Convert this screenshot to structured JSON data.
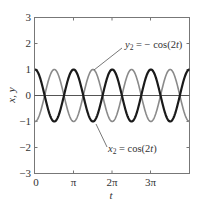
{
  "chart_data": {
    "type": "line",
    "title": "",
    "xlabel": "t",
    "ylabel": "x, y",
    "xlim": [
      0,
      12.566
    ],
    "ylim": [
      -3,
      3
    ],
    "grid": false,
    "xticks": [
      {
        "value": 0,
        "label": "0"
      },
      {
        "value": 3.14159,
        "label": "π"
      },
      {
        "value": 6.28319,
        "label": "2π"
      },
      {
        "value": 9.42478,
        "label": "3π"
      }
    ],
    "yticks": [
      {
        "value": 3,
        "label": "3"
      },
      {
        "value": 2,
        "label": "2"
      },
      {
        "value": 1,
        "label": "1"
      },
      {
        "value": 0,
        "label": "0"
      },
      {
        "value": -1,
        "label": "−1"
      },
      {
        "value": -2,
        "label": "−2"
      },
      {
        "value": -3,
        "label": "−3"
      }
    ],
    "series": [
      {
        "name": "x2 = cos(2t)",
        "expression": "cos(2t)",
        "color": "#1a1a1a",
        "width": 2.2,
        "amplitude": 1,
        "omega": 2,
        "phase_sign": 1
      },
      {
        "name": "y2 = − cos(2t)",
        "expression": "-cos(2t)",
        "color": "#8a8a8a",
        "width": 1.6,
        "amplitude": 1,
        "omega": 2,
        "phase_sign": -1
      }
    ],
    "zero_line": {
      "y": 0,
      "color": "#555555"
    },
    "annotations": [
      {
        "text_main": "y",
        "text_sub": "2",
        "text_rest": " = − cos(2t)",
        "for": "y2 = − cos(2t)",
        "label_x": 124,
        "label_y": 47,
        "pointer_from": [
          122,
          48
        ],
        "pointer_to": [
          94,
          70
        ]
      },
      {
        "text_main": "x",
        "text_sub": "2",
        "text_rest": " = cos(2t)",
        "for": "x2 = cos(2t)",
        "label_x": 108,
        "label_y": 152,
        "pointer_from": [
          106,
          146
        ],
        "pointer_to": [
          95,
          124
        ]
      }
    ]
  },
  "labels": {
    "xlabel": "t",
    "ylabel": "x, y",
    "ann_y_main": "y",
    "ann_y_sub": "2",
    "ann_y_rest": " = − cos(2",
    "ann_y_t": "t",
    "ann_y_close": ")",
    "ann_x_main": "x",
    "ann_x_sub": "2",
    "ann_x_rest": " = cos(2",
    "ann_x_t": "t",
    "ann_x_close": ")",
    "xtick_0": "0",
    "xtick_1": "π",
    "xtick_2": "2π",
    "xtick_3": "3π",
    "ytick_3": "3",
    "ytick_2": "2",
    "ytick_1": "1",
    "ytick_0": "0",
    "ytick_m1": "−1",
    "ytick_m2": "−2",
    "ytick_m3": "−3"
  }
}
